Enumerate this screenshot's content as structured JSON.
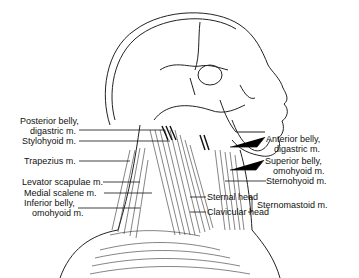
{
  "figure": {
    "labels_left": [
      {
        "line1": "Posterior belly,",
        "line2": "digastric m."
      },
      {
        "line1": "Stylohyoid m."
      },
      {
        "line1": "Trapezius m."
      },
      {
        "line1": "Levator scapulae m."
      },
      {
        "line1": "Medial scalene m."
      },
      {
        "line1": "Inferior belly,",
        "line2": "omohyoid m."
      }
    ],
    "labels_right": [
      {
        "line1": "Anterior belly,",
        "line2": "digastric m."
      },
      {
        "line1": "Superior belly,",
        "line2": "omohyoid m."
      },
      {
        "line1": "Sternohyoid m."
      }
    ],
    "sternomastoid": {
      "heads": [
        "Sternal head",
        "Clavicular head"
      ],
      "label": "Sternomastoid m."
    }
  }
}
